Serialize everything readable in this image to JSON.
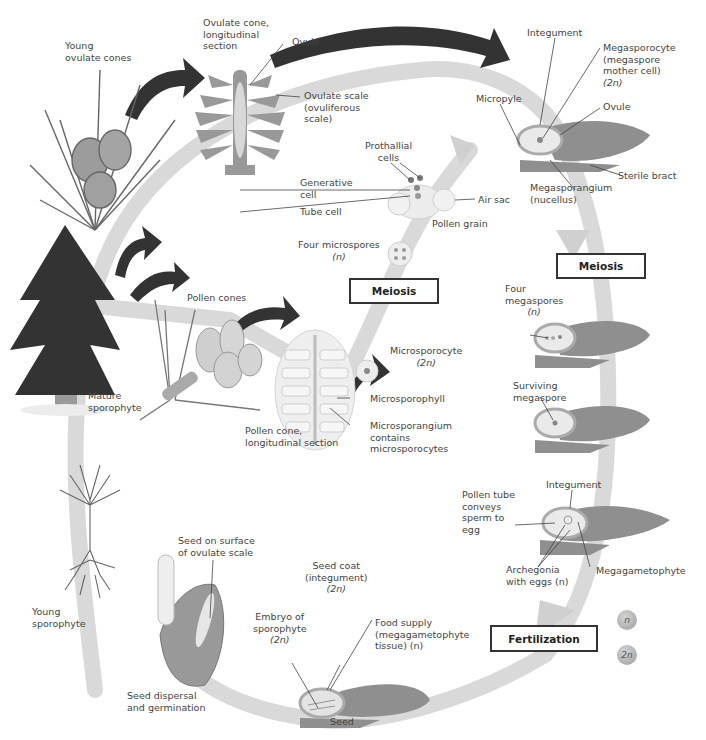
{
  "diagram": {
    "colors": {
      "cycle_path": "#d6d6d6",
      "black_arrow": "#333333",
      "tissue_gray": "#8f8f8f",
      "pale_gray": "#e6e6e6",
      "legend_haploid": "#bdbdbd",
      "legend_diploid": "#c8c8c8"
    }
  },
  "labels": {
    "young_ovulate_cones": [
      "Young",
      "ovulate cones"
    ],
    "ovulate_cone_section": [
      "Ovulate cone,",
      "longitudinal",
      "section"
    ],
    "ovule_top": "Ovule",
    "ovulate_scale": [
      "Ovulate scale",
      "(ovuliferous",
      "scale)"
    ],
    "integument_top": "Integument",
    "megasporocyte": [
      "Megasporocyte",
      "(megaspore",
      "mother cell)",
      "(2n)"
    ],
    "micropyle": "Micropyle",
    "ovule_right": "Ovule",
    "sterile_bract": "Sterile bract",
    "megasporangium": [
      "Megasporangium",
      "(nucellus)"
    ],
    "prothallial_cells": [
      "Prothallial",
      "cells"
    ],
    "generative_cell": [
      "Generative",
      "cell"
    ],
    "tube_cell": "Tube cell",
    "air_sac": "Air sac",
    "pollen_grain": "Pollen grain",
    "four_microspores": [
      "Four microspores",
      "(n)"
    ],
    "meiosis_left": "Meiosis",
    "meiosis_right": "Meiosis",
    "four_megaspores": [
      "Four",
      "megaspores",
      "(n)"
    ],
    "pollen_cones": "Pollen cones",
    "microsporocyte": [
      "Microsporocyte",
      "(2n)"
    ],
    "mature_sporophyte": [
      "Mature",
      "sporophyte"
    ],
    "microsporophyll": "Microsporophyll",
    "microsporangium": [
      "Microsporangium",
      "contains",
      "microsporocytes"
    ],
    "pollen_cone_section": [
      "Pollen cone,",
      "longitudinal section"
    ],
    "surviving_megaspore": [
      "Surviving",
      "megaspore"
    ],
    "integument_lower": "Integument",
    "pollen_tube": [
      "Pollen tube",
      "conveys",
      "sperm to",
      "egg"
    ],
    "archegonia": [
      "Archegonia",
      "with eggs (n)"
    ],
    "megagametophyte": "Megagametophyte",
    "seed_on_surface": [
      "Seed on surface",
      "of ovulate scale"
    ],
    "seed_coat": [
      "Seed coat",
      "(integument)",
      "(2n)"
    ],
    "embryo": [
      "Embryo of",
      "sporophyte",
      "(2n)"
    ],
    "food_supply": [
      "Food supply",
      "(megagametophyte",
      "tissue) (n)"
    ],
    "young_sporophyte": [
      "Young",
      "sporophyte"
    ],
    "seed_dispersal": [
      "Seed dispersal",
      "and germination"
    ],
    "seed": "Seed",
    "fertilization": "Fertilization"
  },
  "legend": {
    "haploid": "n",
    "diploid": "2n"
  }
}
